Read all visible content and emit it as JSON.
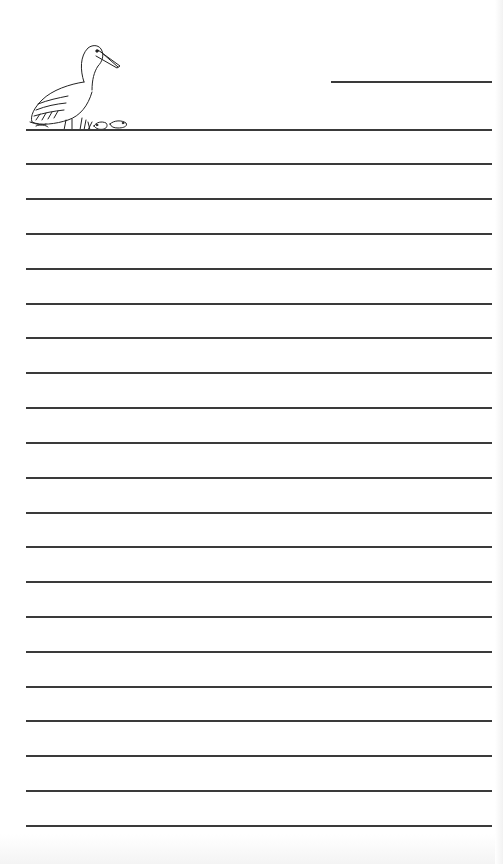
{
  "document": {
    "type": "lined writing paper",
    "illustration": "pelican-with-small-animals",
    "header_line": {
      "x1": 331,
      "x2": 492,
      "y": 82
    },
    "ruled_lines": {
      "count": 21,
      "x1": 26,
      "x2": 492,
      "y_positions": [
        130,
        164,
        199,
        234,
        269,
        304,
        338,
        373,
        408,
        443,
        478,
        513,
        547,
        582,
        617,
        652,
        687,
        721,
        756,
        791,
        826
      ]
    },
    "line_color": "#3a3a3a",
    "background_color": "#ffffff"
  }
}
